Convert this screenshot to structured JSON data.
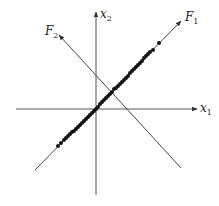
{
  "diagram": {
    "type": "pca-axes",
    "labels": {
      "x1": {
        "main": "x",
        "sub": "1"
      },
      "x2": {
        "main": "x",
        "sub": "2"
      },
      "F1": {
        "main": "F",
        "sub": "1"
      },
      "F2": {
        "main": "F",
        "sub": "2"
      }
    },
    "axes": {
      "x1": {
        "from": [
          16,
          109
        ],
        "to": [
          197,
          109
        ]
      },
      "x2": {
        "from": [
          96,
          195
        ],
        "to": [
          96,
          12
        ]
      }
    },
    "components": {
      "F1": {
        "from": [
          35,
          170
        ],
        "to": [
          181,
          21
        ]
      },
      "F2": {
        "from": [
          181,
          168
        ],
        "to": [
          59,
          35
        ]
      }
    },
    "colors": {
      "axis": "#555555",
      "line": "#444444",
      "point": "#111111",
      "text": "#222222",
      "background": "#ffffff"
    },
    "points": [
      [
        58,
        146
      ],
      [
        61,
        143
      ],
      [
        64,
        140
      ],
      [
        66,
        138
      ],
      [
        68,
        136
      ],
      [
        70,
        134
      ],
      [
        72,
        132
      ],
      [
        74,
        131
      ],
      [
        76,
        129
      ],
      [
        78,
        127
      ],
      [
        80,
        125
      ],
      [
        82,
        123
      ],
      [
        84,
        121
      ],
      [
        86,
        119
      ],
      [
        88,
        117
      ],
      [
        90,
        115
      ],
      [
        92,
        113
      ],
      [
        94,
        111
      ],
      [
        96,
        109
      ],
      [
        98,
        107
      ],
      [
        100,
        104
      ],
      [
        102,
        102
      ],
      [
        104,
        100
      ],
      [
        106,
        98
      ],
      [
        108,
        96
      ],
      [
        110,
        94
      ],
      [
        112,
        92
      ],
      [
        114,
        89
      ],
      [
        116,
        88
      ],
      [
        118,
        86
      ],
      [
        120,
        84
      ],
      [
        122,
        82
      ],
      [
        124,
        80
      ],
      [
        126,
        78
      ],
      [
        128,
        76
      ],
      [
        130,
        73
      ],
      [
        132,
        71
      ],
      [
        134,
        69
      ],
      [
        136,
        67
      ],
      [
        138,
        65
      ],
      [
        140,
        63
      ],
      [
        142,
        61
      ],
      [
        144,
        58
      ],
      [
        146,
        56
      ],
      [
        148,
        54
      ],
      [
        150,
        52
      ],
      [
        153,
        50
      ],
      [
        159,
        43
      ]
    ]
  }
}
